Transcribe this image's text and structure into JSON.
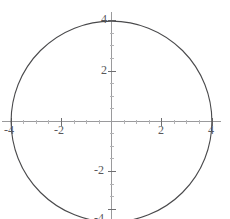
{
  "figure": {
    "kind": "cartesian-plot",
    "width": 230,
    "height": 219,
    "background": "#ffffff",
    "axis_color": "#9a9a9c",
    "curve_color": "#4a4a4c",
    "label_color": "#58585a"
  },
  "chart_data": {
    "type": "line",
    "title": "",
    "subtitle": "",
    "xlabel": "",
    "ylabel": "",
    "curve": {
      "name": "circle",
      "equation": "x^2 + y^2 = 16",
      "center_x": 0,
      "center_y": 0,
      "radius": 4,
      "closed": true,
      "color": "#4a4a4c",
      "line_width": 1
    },
    "xlim": [
      -4.35,
      4.35
    ],
    "ylim": [
      -4.35,
      4.35
    ],
    "grid": false,
    "legend": null,
    "legend_position": "none",
    "x_ticks": [
      {
        "value": -4,
        "label": "-4"
      },
      {
        "value": -2,
        "label": "-2"
      },
      {
        "value": 2,
        "label": "2"
      },
      {
        "value": 4,
        "label": "4"
      }
    ],
    "y_ticks": [
      {
        "value": -4,
        "label": "-4"
      },
      {
        "value": -2,
        "label": "-2"
      },
      {
        "value": 2,
        "label": "2"
      },
      {
        "value": 4,
        "label": "4"
      }
    ],
    "minor_tick_spacing": 0.5,
    "points": [
      {
        "x": 4,
        "y": 0
      },
      {
        "x": 0,
        "y": 4
      },
      {
        "x": -4,
        "y": 0
      },
      {
        "x": 0,
        "y": -4
      }
    ]
  },
  "labels": {
    "x_neg4": "-4",
    "x_neg2": "-2",
    "x_pos2": "2",
    "x_pos4": "4",
    "y_neg4": "-4",
    "y_neg2": "-2",
    "y_pos2": "2",
    "y_pos4": "4"
  },
  "clipped_top_text": {
    "fragment": ""
  }
}
